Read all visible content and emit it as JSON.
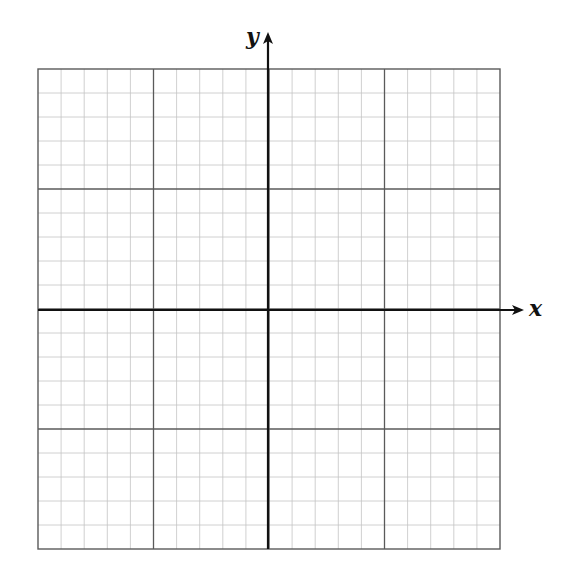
{
  "graph": {
    "x_axis_label": "x",
    "y_axis_label": "y",
    "grid": {
      "left": 38,
      "top": 69,
      "right": 500,
      "bottom": 549,
      "cols": 20,
      "rows": 20,
      "major_every": 5
    },
    "origin": {
      "x": 268,
      "y": 310
    },
    "x_arrow_tip": 524,
    "y_arrow_tip": 32,
    "colors": {
      "minor_line": "#c4c4c4",
      "major_line": "#5a5a5a",
      "axis": "#111111",
      "background": "#ffffff"
    }
  }
}
